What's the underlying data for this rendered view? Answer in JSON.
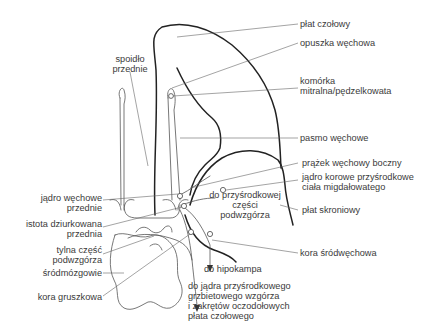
{
  "labels": {
    "plat_czolowy": "płat czołowy",
    "opuszka_wechowa": "opuszka węchowa",
    "komorka_mitralna": "komórka\nmitralna/pędzelkowata",
    "pasmo_wechowe": "pasmo węchowe",
    "prazek_wechowy_boczny": "prążek węchowy boczny",
    "jadro_korowe": "jądro korowe przyśrodkowe\nciała migdałowatego",
    "plat_skroniowy": "płat skroniowy",
    "kora_srodwechowa": "kora śródwęchowa",
    "spoidlo_przednie": "spoidło\nprzednie",
    "jadro_wechowe_przednie": "jądro węchowe\nprzednie",
    "istota_dziurkowana": "istota dziurkowana\nprzednia",
    "tylna_czesc_podwzgorza": "tylna część\npodwzgórza",
    "srodmozgowie": "śródmózgowie",
    "kora_gruszkowa": "kora gruszkowa",
    "do_przysrodkowej": "do przyśrodkowej\nczęści\npodwzgórza",
    "do_hipokampa": "do hipokampa",
    "do_jadra": "do jądra przyśrodkowego\ngrzbietowego wzgórza\ni zakrętów oczodołowych\npłata czołowego"
  },
  "colors": {
    "outline": "#222222",
    "leader": "#666666",
    "text": "#3a3a3a"
  }
}
